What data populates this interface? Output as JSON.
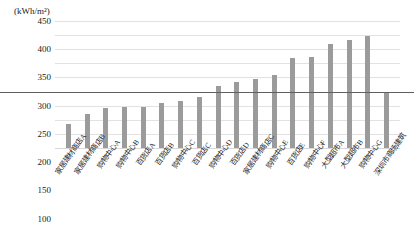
{
  "chart_data": {
    "type": "bar",
    "title": "",
    "subtitle": "",
    "xlabel": "",
    "ylabel": "(kWh/m²)",
    "ylim": [
      0,
      450
    ],
    "ytick_step": 50,
    "yticks": [
      "450",
      "400",
      "350",
      "300",
      "250",
      "200",
      "150",
      "100",
      "50",
      "0"
    ],
    "grid": true,
    "legend": "none",
    "bar_color": "#9b9b9b",
    "reference_line": {
      "value": 200,
      "color": "#5f5f5f",
      "label": ""
    },
    "categories": [
      "家居建材商店A",
      "家居建材商店B",
      "购物中心A",
      "购物中心B",
      "百货店A",
      "百货店B",
      "购物中心C",
      "百货店C",
      "购物中心D",
      "百货店D",
      "家居建材商店C",
      "购物中心E",
      "百货店E",
      "购物中心F",
      "大型超市A",
      "大型超市B",
      "购物中心G",
      "深圳市商场建筑"
    ],
    "values": [
      85,
      122,
      141,
      144,
      146,
      158,
      168,
      182,
      218,
      234,
      243,
      259,
      318,
      321,
      368,
      384,
      397,
      197
    ]
  }
}
